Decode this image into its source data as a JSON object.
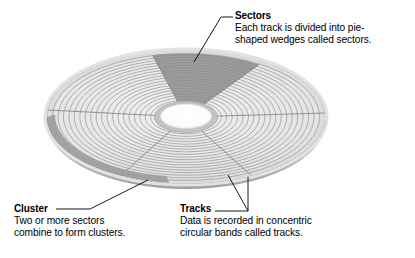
{
  "figure": {
    "name": "disk-platter-diagram",
    "background_color": "#ffffff",
    "line_color": "#000000"
  },
  "callouts": [
    {
      "id": "sectors",
      "title": "Sectors",
      "lines": [
        "Each track is divided into pie-",
        "shaped wedges called sectors."
      ]
    },
    {
      "id": "cluster",
      "title": "Cluster",
      "lines": [
        "Two or more sectors",
        "combine to form clusters."
      ]
    },
    {
      "id": "tracks",
      "title": "Tracks",
      "lines": [
        "Data is recorded in concentric",
        "circular bands called tracks."
      ]
    }
  ],
  "disk": {
    "center_x": 186,
    "center_y": 117,
    "outer_rx": 139,
    "outer_ry": 66,
    "hub_rx": 30,
    "hub_ry": 15,
    "track_count": 20,
    "sector_divider_count": 6,
    "highlight_sector_label": "Sectors",
    "highlight_cluster_label": "Cluster",
    "colors": {
      "platter_fill": "#e9e9e9",
      "platter_edge": "#c9c9c9",
      "track_line": "#a9a9a9",
      "sector_line": "#8d8d8d",
      "highlight_sector": "#8f8f8f",
      "cluster_band": "#9a9a9a",
      "hub_ring": "#bdbdbd",
      "hub_hole": "#ffffff",
      "rim_shadow": "#d6d6d6"
    }
  }
}
